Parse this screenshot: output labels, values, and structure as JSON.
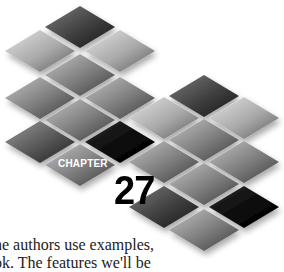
{
  "chapter": {
    "label": "CHAPTER",
    "number": "27"
  },
  "body_text": {
    "line1": "he authors use examples,",
    "line2": "ok.  The features we'll be"
  },
  "decoration": {
    "type": "diamond-tile-mosaic",
    "tiles": [
      {
        "cx": 80,
        "cy": 27,
        "tone": "dark"
      },
      {
        "cx": 40,
        "cy": 51,
        "tone": "light"
      },
      {
        "cx": 120,
        "cy": 51,
        "tone": "light"
      },
      {
        "cx": 80,
        "cy": 75,
        "tone": "mid"
      },
      {
        "cx": 40,
        "cy": 98,
        "tone": "mid"
      },
      {
        "cx": 120,
        "cy": 98,
        "tone": "mid"
      },
      {
        "cx": 204,
        "cy": 96,
        "tone": "dark"
      },
      {
        "cx": 80,
        "cy": 120,
        "tone": "mid"
      },
      {
        "cx": 164,
        "cy": 118,
        "tone": "light"
      },
      {
        "cx": 244,
        "cy": 118,
        "tone": "light"
      },
      {
        "cx": 40,
        "cy": 142,
        "tone": "darkmid"
      },
      {
        "cx": 120,
        "cy": 142,
        "tone": "black"
      },
      {
        "cx": 204,
        "cy": 140,
        "tone": "mid"
      },
      {
        "cx": 80,
        "cy": 165,
        "tone": "mid"
      },
      {
        "cx": 164,
        "cy": 162,
        "tone": "mid"
      },
      {
        "cx": 244,
        "cy": 162,
        "tone": "mid"
      },
      {
        "cx": 204,
        "cy": 184,
        "tone": "mid"
      },
      {
        "cx": 164,
        "cy": 207,
        "tone": "dark"
      },
      {
        "cx": 244,
        "cy": 207,
        "tone": "black"
      },
      {
        "cx": 204,
        "cy": 230,
        "tone": "mid"
      }
    ]
  }
}
